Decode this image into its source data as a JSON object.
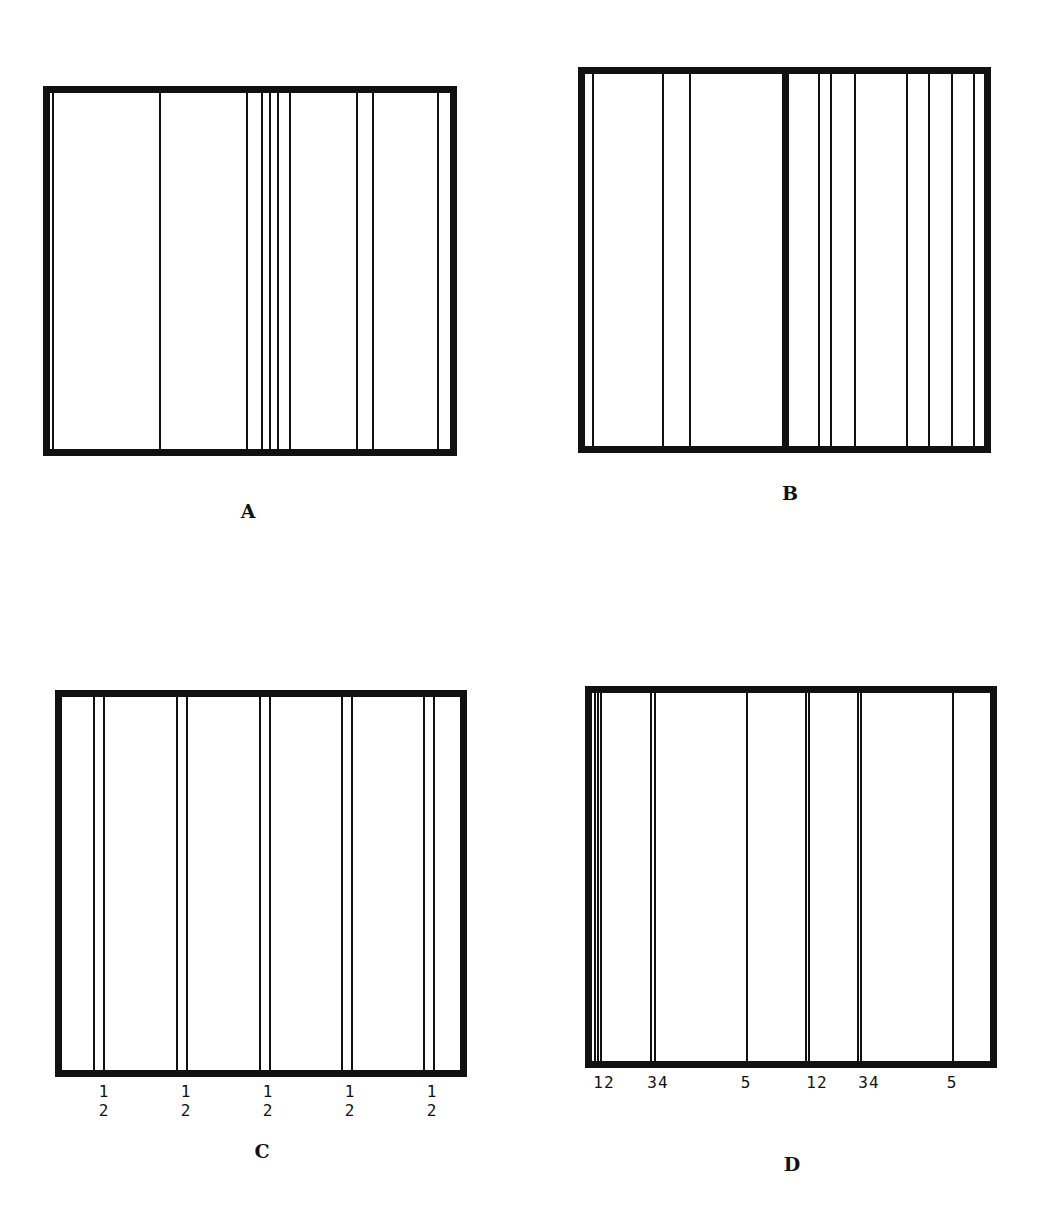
{
  "figure": {
    "panels": [
      {
        "id": "A",
        "caption": "A",
        "caption_pos": [
          248,
          500
        ],
        "frame": {
          "x": 43,
          "y": 86,
          "w": 414,
          "h": 370,
          "border": 7
        },
        "lines": [
          53,
          160,
          247,
          262,
          270,
          278,
          290,
          357,
          373,
          438
        ],
        "thick_lines": [],
        "labels": []
      },
      {
        "id": "B",
        "caption": "B",
        "caption_pos": [
          790,
          482
        ],
        "frame": {
          "x": 578,
          "y": 67,
          "w": 413,
          "h": 386,
          "border": 7
        },
        "lines": [
          593,
          663,
          690,
          819,
          831,
          855,
          907,
          929,
          952,
          974
        ],
        "thick_lines": [
          785
        ],
        "labels": []
      },
      {
        "id": "C",
        "caption": "C",
        "caption_pos": [
          262,
          1140
        ],
        "frame": {
          "x": 55,
          "y": 690,
          "w": 412,
          "h": 387,
          "border": 7
        },
        "lines": [
          94,
          104,
          177,
          187,
          260,
          270,
          342,
          352,
          424,
          434
        ],
        "thick_lines": [],
        "labels": [
          {
            "text": "1 2",
            "x": 104,
            "y": 1082
          },
          {
            "text": "1 2",
            "x": 186,
            "y": 1082
          },
          {
            "text": "1 2",
            "x": 268,
            "y": 1082
          },
          {
            "text": "1 2",
            "x": 350,
            "y": 1082
          },
          {
            "text": "1 2",
            "x": 432,
            "y": 1082
          }
        ]
      },
      {
        "id": "D",
        "caption": "D",
        "caption_pos": [
          792,
          1153
        ],
        "frame": {
          "x": 585,
          "y": 686,
          "w": 412,
          "h": 382,
          "border": 7
        },
        "lines": [
          595,
          598,
          601,
          651,
          655,
          747,
          806,
          809,
          858,
          861,
          953
        ],
        "thick_lines": [],
        "labels": [
          {
            "text": "12",
            "x": 604,
            "y": 1073
          },
          {
            "text": "34",
            "x": 658,
            "y": 1073
          },
          {
            "text": "5",
            "x": 746,
            "y": 1073
          },
          {
            "text": "12",
            "x": 817,
            "y": 1073
          },
          {
            "text": "34",
            "x": 869,
            "y": 1073
          },
          {
            "text": "5",
            "x": 952,
            "y": 1073
          }
        ]
      }
    ],
    "colors": {
      "ink": "#111111",
      "background": "#ffffff"
    }
  }
}
